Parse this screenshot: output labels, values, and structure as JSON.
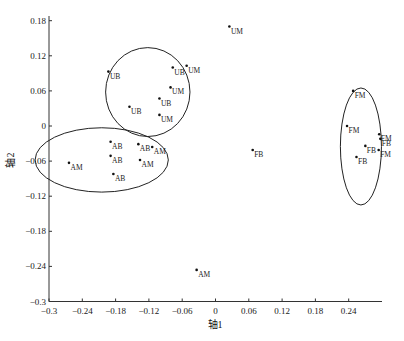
{
  "chart_data": {
    "type": "scatter",
    "title": "",
    "xlabel": "轴1",
    "ylabel": "轴2",
    "xlim": [
      -0.3,
      0.3
    ],
    "ylim": [
      -0.3,
      0.19
    ],
    "xticks": [
      -0.3,
      -0.24,
      -0.18,
      -0.12,
      -0.06,
      0,
      0.06,
      0.12,
      0.18,
      0.24
    ],
    "xtick_labels": [
      "−0.3",
      "−0.24",
      "−0.18",
      "−0.12",
      "−0.06",
      "0",
      "0.06",
      "0.12",
      "0.18",
      "0.24"
    ],
    "yticks": [
      0.18,
      0.12,
      0.06,
      0,
      -0.06,
      -0.12,
      -0.18,
      -0.24,
      -0.3
    ],
    "ytick_labels": [
      "0.18",
      "0.12",
      "0.06",
      "0",
      "−0.06",
      "−0.12",
      "−0.18",
      "−0.24",
      "−0.3"
    ],
    "grid": false,
    "legend": null,
    "points": [
      {
        "label": "UM",
        "x": 0.025,
        "y": 0.17
      },
      {
        "label": "UB",
        "x": -0.193,
        "y": 0.093
      },
      {
        "label": "UB",
        "x": -0.077,
        "y": 0.1
      },
      {
        "label": "UM",
        "x": -0.052,
        "y": 0.103
      },
      {
        "label": "UM",
        "x": -0.081,
        "y": 0.066
      },
      {
        "label": "UB",
        "x": -0.101,
        "y": 0.047
      },
      {
        "label": "UB",
        "x": -0.155,
        "y": 0.033
      },
      {
        "label": "UM",
        "x": -0.101,
        "y": 0.019
      },
      {
        "label": "AB",
        "x": -0.189,
        "y": -0.027
      },
      {
        "label": "AB",
        "x": -0.139,
        "y": -0.031
      },
      {
        "label": "AM",
        "x": -0.114,
        "y": -0.036
      },
      {
        "label": "AB",
        "x": -0.189,
        "y": -0.051
      },
      {
        "label": "AM",
        "x": -0.136,
        "y": -0.058
      },
      {
        "label": "AM",
        "x": -0.264,
        "y": -0.063
      },
      {
        "label": "AB",
        "x": -0.184,
        "y": -0.082
      },
      {
        "label": "FB",
        "x": 0.067,
        "y": -0.041
      },
      {
        "label": "AM",
        "x": -0.034,
        "y": -0.246
      },
      {
        "label": "FM",
        "x": 0.248,
        "y": 0.06
      },
      {
        "label": "FM",
        "x": 0.237,
        "y": 0.0
      },
      {
        "label": "FM",
        "x": 0.295,
        "y": -0.014
      },
      {
        "label": "FB",
        "x": 0.297,
        "y": -0.022
      },
      {
        "label": "FB",
        "x": 0.27,
        "y": -0.034
      },
      {
        "label": "FM",
        "x": 0.294,
        "y": -0.041
      },
      {
        "label": "FB",
        "x": 0.254,
        "y": -0.053
      }
    ],
    "ellipses": [
      {
        "name": "U-group",
        "cx": -0.122,
        "cy": 0.058,
        "rx": 0.076,
        "ry": 0.076
      },
      {
        "name": "A-group",
        "cx": -0.205,
        "cy": -0.058,
        "rx": 0.12,
        "ry": 0.055
      },
      {
        "name": "F-group",
        "cx": 0.262,
        "cy": -0.035,
        "rx": 0.037,
        "ry": 0.1
      }
    ]
  }
}
